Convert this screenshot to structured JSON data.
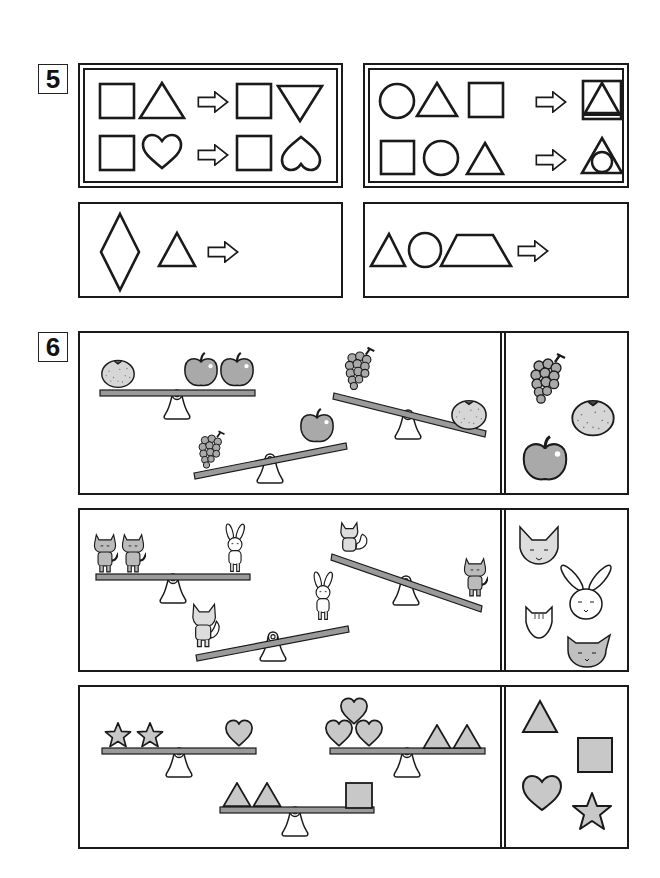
{
  "page": {
    "background": "#ffffff",
    "ink_color": "#1a1a1a",
    "fill_gray": "#c8c8c8",
    "bar_gray": "#9a9a9a"
  },
  "question5": {
    "number": "5",
    "examples": [
      {
        "name": "example-left",
        "rows": [
          {
            "inputs": [
              "square-icon",
              "triangle-icon"
            ],
            "arrow": "arrow-right-icon",
            "outputs": [
              "square-icon",
              "inverted-triangle-icon"
            ]
          },
          {
            "inputs": [
              "square-icon",
              "heart-icon"
            ],
            "arrow": "arrow-right-icon",
            "outputs": [
              "square-icon",
              "inverted-heart-icon"
            ]
          }
        ]
      },
      {
        "name": "example-right",
        "rows": [
          {
            "inputs": [
              "circle-icon",
              "triangle-icon",
              "square-icon"
            ],
            "arrow": "arrow-right-icon",
            "outputs": [
              "triangle-in-square-icon"
            ]
          },
          {
            "inputs": [
              "square-icon",
              "circle-icon",
              "triangle-icon"
            ],
            "arrow": "arrow-right-icon",
            "outputs": [
              "circle-in-triangle-icon"
            ]
          }
        ]
      }
    ],
    "problems": [
      {
        "name": "problem-left",
        "inputs": [
          "diamond-icon",
          "triangle-icon"
        ],
        "arrow": "arrow-right-icon",
        "answer": ""
      },
      {
        "name": "problem-right",
        "inputs": [
          "triangle-icon",
          "circle-icon",
          "trapezoid-icon"
        ],
        "arrow": "arrow-right-icon",
        "answer": ""
      }
    ]
  },
  "question6": {
    "number": "6",
    "panels": [
      {
        "name": "fruits",
        "seesaws": [
          {
            "left": [
              "orange-icon"
            ],
            "right": [
              "apple-icon",
              "apple-icon"
            ],
            "tilt": "level"
          },
          {
            "left": [
              "grapes-icon"
            ],
            "right": [
              "apple-icon"
            ],
            "tilt": "left-down"
          },
          {
            "left": [
              "grapes-icon"
            ],
            "right": [
              "orange-icon"
            ],
            "tilt": "right-down"
          }
        ],
        "choices": [
          "grapes-icon",
          "orange-icon",
          "apple-icon"
        ]
      },
      {
        "name": "animals",
        "seesaws": [
          {
            "left": [
              "cat-icon",
              "cat-icon"
            ],
            "right": [
              "rabbit-icon"
            ],
            "tilt": "level"
          },
          {
            "left": [
              "fox-icon"
            ],
            "right": [
              "rabbit-icon"
            ],
            "tilt": "left-down"
          },
          {
            "left": [
              "squirrel-icon"
            ],
            "right": [
              "cat-icon"
            ],
            "tilt": "right-down"
          }
        ],
        "choices": [
          "fox-face-icon",
          "rabbit-face-icon",
          "mouse-face-icon",
          "cat-face-icon"
        ]
      },
      {
        "name": "shapes",
        "seesaws": [
          {
            "left": [
              "star-icon",
              "star-icon"
            ],
            "right": [
              "heart-icon"
            ],
            "tilt": "level"
          },
          {
            "left": [
              "heart-icon",
              "heart-icon",
              "heart-icon"
            ],
            "right": [
              "triangle-icon",
              "triangle-icon"
            ],
            "tilt": "level"
          },
          {
            "left": [
              "triangle-icon",
              "triangle-icon"
            ],
            "right": [
              "square-icon"
            ],
            "tilt": "level"
          }
        ],
        "choices": [
          "triangle-icon",
          "square-icon",
          "heart-icon",
          "star-icon"
        ]
      }
    ]
  }
}
